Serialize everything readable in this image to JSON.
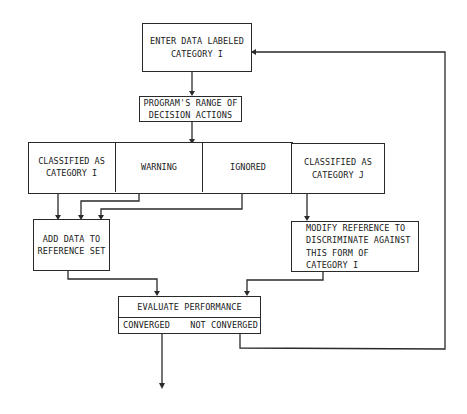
{
  "diagram": {
    "type": "flowchart",
    "nodes": {
      "enter_data": {
        "label": "ENTER DATA LABELED\nCATEGORY I"
      },
      "decision_range": {
        "label": "PROGRAM'S RANGE OF\nDECISION ACTIONS"
      },
      "decisions": [
        {
          "id": "classified_i",
          "label": "CLASSIFIED AS\nCATEGORY I"
        },
        {
          "id": "warning",
          "label": "WARNING"
        },
        {
          "id": "ignored",
          "label": "IGNORED"
        },
        {
          "id": "classified_j",
          "label": "CLASSIFIED AS\nCATEGORY J"
        }
      ],
      "add_data": {
        "label": "ADD DATA TO\nREFERENCE SET"
      },
      "modify_reference": {
        "label": "MODIFY REFERENCE TO\nDISCRIMINATE AGAINST\nTHIS FORM OF\n     CATEGORY I"
      },
      "evaluate": {
        "label": "EVALUATE PERFORMANCE",
        "outcomes": [
          {
            "id": "converged",
            "label": "CONVERGED"
          },
          {
            "id": "not_converged",
            "label": "NOT CONVERGED"
          }
        ]
      }
    },
    "edges": [
      {
        "from": "enter_data",
        "to": "decision_range"
      },
      {
        "from": "decision_range",
        "to": "decisions"
      },
      {
        "from": "classified_i",
        "to": "add_data"
      },
      {
        "from": "warning",
        "to": "add_data"
      },
      {
        "from": "ignored",
        "to": "add_data"
      },
      {
        "from": "classified_j",
        "to": "modify_reference"
      },
      {
        "from": "add_data",
        "to": "evaluate"
      },
      {
        "from": "modify_reference",
        "to": "evaluate"
      },
      {
        "from": "not_converged",
        "to": "enter_data"
      },
      {
        "from": "converged",
        "to": "exit"
      }
    ],
    "colors": {
      "line": "#2a2a2a",
      "background": "#ffffff",
      "text": "#1a1a1a"
    }
  }
}
